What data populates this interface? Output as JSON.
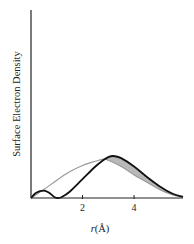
{
  "chart_data": {
    "type": "line",
    "title": "",
    "xlabel_var": "r",
    "xlabel_unit": "(Å)",
    "xlabel": "r(Å)",
    "ylabel": "Surface Electron Density",
    "xlim": [
      0,
      5.9
    ],
    "ylim": [
      0,
      1
    ],
    "x_ticks": [
      2,
      4
    ],
    "x_tick_labels": [
      "2",
      "4"
    ],
    "y_ticks": [],
    "grid": false,
    "legend": null,
    "colors": {
      "black_curve": "#111111",
      "gray_curve": "#999999",
      "shaded_region": "#b5b5b5",
      "axis": "#222222"
    },
    "series": [
      {
        "name": "black curve (with inner node)",
        "style": "thick black",
        "x": [
          0.0,
          0.2,
          0.5,
          0.7,
          0.9,
          1.05,
          1.2,
          1.5,
          2.0,
          2.5,
          2.8,
          3.0,
          3.2,
          3.5,
          4.0,
          4.5,
          5.0,
          5.5,
          5.9
        ],
        "y": [
          0.0,
          0.05,
          0.07,
          0.05,
          0.01,
          0.0,
          0.01,
          0.06,
          0.18,
          0.3,
          0.36,
          0.39,
          0.4,
          0.38,
          0.3,
          0.2,
          0.11,
          0.04,
          0.01
        ]
      },
      {
        "name": "gray curve (smooth)",
        "style": "thin gray",
        "x": [
          0.0,
          0.5,
          1.0,
          1.5,
          2.0,
          2.5,
          2.8,
          3.0,
          3.5,
          4.0,
          4.5,
          5.0,
          5.5,
          5.9
        ],
        "y": [
          0.0,
          0.08,
          0.17,
          0.25,
          0.31,
          0.35,
          0.37,
          0.36,
          0.3,
          0.22,
          0.15,
          0.08,
          0.03,
          0.01
        ]
      }
    ],
    "annotations": [
      "Shaded region between black and gray curves for r ≈ 2.8–5.9 Å"
    ]
  }
}
